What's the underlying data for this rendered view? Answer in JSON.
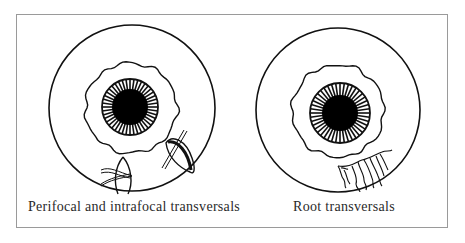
{
  "figure": {
    "panels": [
      {
        "id": "left",
        "caption": "Perifocal and intrafocal transversals",
        "eye": {
          "cx": 132,
          "cy": 108,
          "r_outer": 83,
          "limbus_r": 46,
          "iris_r": 28,
          "pupil_r": 18
        },
        "features": [
          "perifocal-suture-lesion",
          "intrafocal-suture-lesion"
        ]
      },
      {
        "id": "right",
        "caption": "Root transversals",
        "eye": {
          "cx": 338,
          "cy": 110,
          "r_outer": 82,
          "limbus_r": 46,
          "iris_r": 30,
          "pupil_r": 18
        },
        "features": [
          "root-vessels"
        ]
      }
    ],
    "colors": {
      "stroke": "#111111",
      "frame": "#9a9a9a",
      "background": "#ffffff"
    }
  }
}
